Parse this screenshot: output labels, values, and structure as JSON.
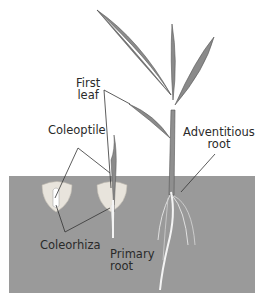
{
  "diagram": {
    "labels": {
      "first_leaf_line1": "First",
      "first_leaf_line2": "leaf",
      "coleoptile": "Coleoptile",
      "adventitious_line1": "Adventitious",
      "adventitious_line2": "root",
      "coleorhiza": "Coleorhiza",
      "primary_line1": "Primary",
      "primary_line2": "root"
    },
    "colors": {
      "soil": "#9a9a9a",
      "leaf": "#8a8a8a",
      "leaf_dark": "#555555",
      "seed": "#e8e4dc",
      "root": "#f4f4f4",
      "line": "#333333"
    },
    "stages": [
      "seed with coleoptile and coleorhiza",
      "seedling with first leaf and primary root",
      "plant with adventitious roots"
    ]
  }
}
